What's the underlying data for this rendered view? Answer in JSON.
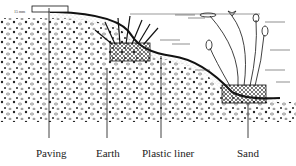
{
  "diagram": {
    "dimension_marker": "15 mm",
    "labels": [
      {
        "text": "Paving",
        "x": 36,
        "y": 147
      },
      {
        "text": "Earth",
        "x": 96,
        "y": 147
      },
      {
        "text": "Plastic liner",
        "x": 142,
        "y": 147
      },
      {
        "text": "Sand",
        "x": 237,
        "y": 147
      }
    ],
    "elements": [
      "paving slab",
      "sloped bank",
      "plastic liner",
      "shelf basket with marginal plants",
      "deep basket with water lilies",
      "water surface"
    ]
  }
}
